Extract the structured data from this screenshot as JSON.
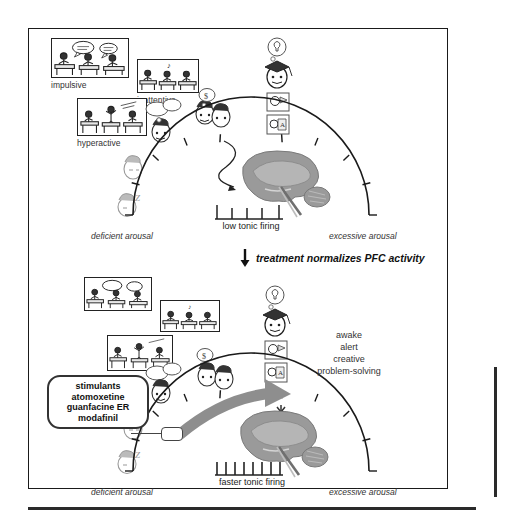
{
  "figure": {
    "background_color": "#ffffff",
    "ink_color": "#1a1a1a",
    "brain_gray": "#9a9a9a",
    "arrow_gray": "#8e8e8e"
  },
  "top_panel": {
    "label": "deficient arousal state in ADHD",
    "vignettes": [
      {
        "name": "impulsive-panel",
        "label": "impulsive"
      },
      {
        "name": "inattentive-panel",
        "label": "inattentive"
      },
      {
        "name": "hyperactive-panel",
        "label": "hyperactive"
      }
    ],
    "arc": {
      "left_label": "deficient arousal",
      "right_label": "excessive arousal",
      "tick_count": 9
    },
    "firing_label": "low tonic firing",
    "spike_count": 5,
    "icons": {
      "graduate": "graduate-cap-head-icon",
      "lightbulb": "lightbulb-thought-icon",
      "reading": "reading-head-icon",
      "writing": "writing-head-icon",
      "sleepy": "drowsy-head-icon",
      "asleep": "sleeping-head-z-icon",
      "distracted": "distracted-head-icon",
      "brain": "sagittal-brain-electrode-icon"
    }
  },
  "transition": {
    "arrow": "down-arrow-icon",
    "text": "treatment normalizes PFC activity"
  },
  "bottom_panel": {
    "label": "normalized arousal state after treatment",
    "vignettes": [
      {
        "name": "impulsive-panel",
        "label": ""
      },
      {
        "name": "inattentive-panel",
        "label": ""
      },
      {
        "name": "hyperactive-panel",
        "label": ""
      }
    ],
    "medications": {
      "name": "medication-callout",
      "lines": [
        "stimulants",
        "atomoxetine",
        "guanfacine ER",
        "modafinil"
      ]
    },
    "outcomes": [
      "awake",
      "alert",
      "creative",
      "problem-solving"
    ],
    "arc": {
      "left_label": "deficient arousal",
      "right_label": "excessive arousal",
      "tick_count": 9
    },
    "firing_label": "faster tonic firing",
    "spike_count": 8,
    "boost_arrow": "thick-gray-curved-arrow-icon",
    "down_marker": "double-chevron-down-icon"
  }
}
